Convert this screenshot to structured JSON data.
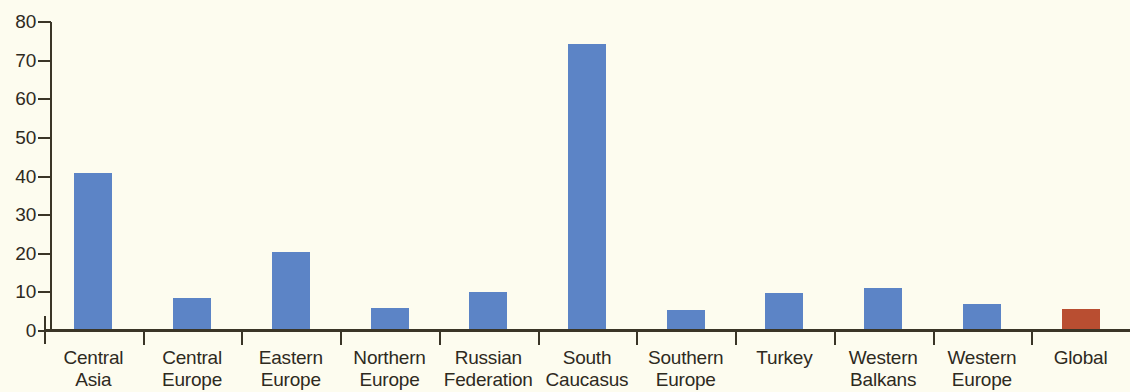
{
  "chart_data": {
    "type": "bar",
    "title": "",
    "subtitle": "",
    "xlabel": "",
    "ylabel": "",
    "ylim": [
      0,
      80
    ],
    "ytick_step": 10,
    "yticks": [
      80,
      70,
      60,
      50,
      40,
      30,
      20,
      10,
      0
    ],
    "grid": false,
    "legend": "none",
    "categories": [
      "Central Asia",
      "Central Europe",
      "Eastern Europe",
      "Northern Europe",
      "Russian Federation",
      "South Caucasus",
      "Southern Europe",
      "Turkey",
      "Western Balkans",
      "Western Europe",
      "Global"
    ],
    "category_lines": [
      [
        "Central",
        "Asia"
      ],
      [
        "Central",
        "Europe"
      ],
      [
        "Eastern",
        "Europe"
      ],
      [
        "Northern",
        "Europe"
      ],
      [
        "Russian",
        "Federation"
      ],
      [
        "South",
        "Caucasus"
      ],
      [
        "Southern",
        "Europe"
      ],
      [
        "Turkey",
        ""
      ],
      [
        "Western",
        "Balkans"
      ],
      [
        "Western",
        "Europe"
      ],
      [
        "Global",
        ""
      ]
    ],
    "values": [
      41,
      8.6,
      20.5,
      6,
      10,
      74.3,
      5.5,
      9.8,
      11.2,
      7,
      5.7
    ],
    "bar_colors": [
      "#5c84c6",
      "#5c84c6",
      "#5c84c6",
      "#5c84c6",
      "#5c84c6",
      "#5c84c6",
      "#5c84c6",
      "#5c84c6",
      "#5c84c6",
      "#5c84c6",
      "#b94e31"
    ],
    "colors": {
      "series_blue": "#5c84c6",
      "global_red": "#b94e31",
      "background": "#fdfcef",
      "axis": "#3a3527",
      "text": "#2e2a1e"
    }
  }
}
